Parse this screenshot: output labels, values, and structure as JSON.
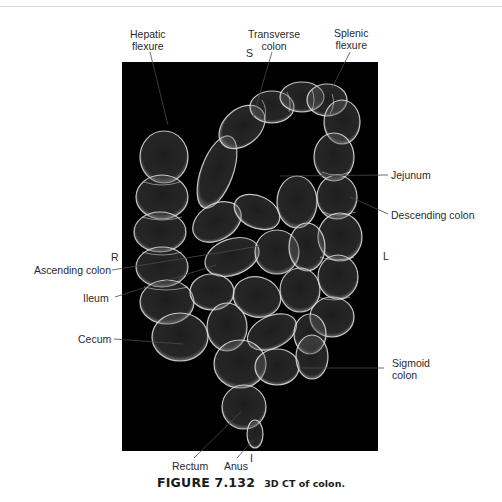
{
  "figure": {
    "label": "FIGURE 7.132",
    "description": "3D CT of colon."
  },
  "orientation": {
    "superior": "S",
    "inferior": "I",
    "right": "R",
    "left": "L"
  },
  "labels": {
    "hepatic_flexure": [
      "Hepatic",
      "flexure"
    ],
    "transverse_colon": [
      "Transverse",
      "colon"
    ],
    "splenic_flexure": [
      "Splenic",
      "flexure"
    ],
    "jejunum": "Jejunum",
    "descending_colon": "Descending colon",
    "ascending_colon": "Ascending colon",
    "ileum": "Ileum",
    "cecum": "Cecum",
    "sigmoid_colon": [
      "Sigmoid",
      "colon"
    ],
    "rectum": "Rectum",
    "anus": "Anus"
  },
  "colors": {
    "panel_background": "#000000",
    "structure_stroke": "#e8e8e8",
    "leader_line": "#555555"
  }
}
